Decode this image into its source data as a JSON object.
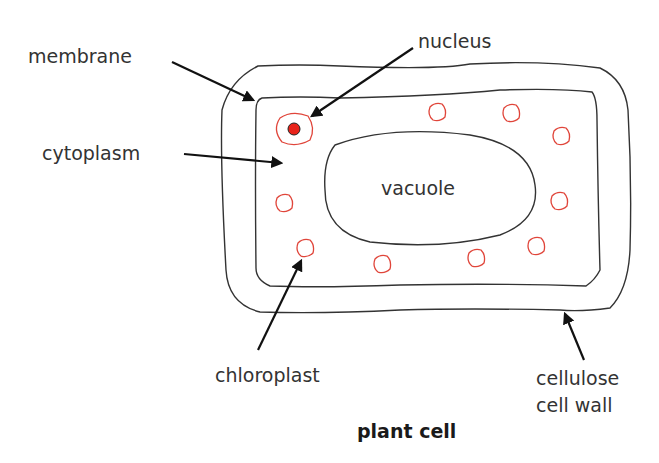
{
  "diagram": {
    "title": "plant cell",
    "labels": {
      "membrane": "membrane",
      "nucleus": "nucleus",
      "cytoplasm": "cytoplasm",
      "vacuole": "vacuole",
      "chloroplast": "chloroplast",
      "cell_wall_line1": "cellulose",
      "cell_wall_line2": "cell wall"
    },
    "colors": {
      "outline": "#333333",
      "chloroplast": "#e0453a",
      "nucleus_fill": "#e8231a",
      "arrow": "#111111"
    },
    "chloroplasts": [
      {
        "x": 437,
        "y": 112
      },
      {
        "x": 511,
        "y": 113
      },
      {
        "x": 561,
        "y": 136
      },
      {
        "x": 559,
        "y": 201
      },
      {
        "x": 536,
        "y": 246
      },
      {
        "x": 476,
        "y": 258
      },
      {
        "x": 382,
        "y": 264
      },
      {
        "x": 305,
        "y": 248
      },
      {
        "x": 284,
        "y": 203
      }
    ]
  }
}
